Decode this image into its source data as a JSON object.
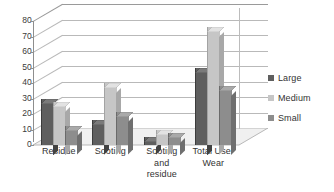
{
  "chart_data": {
    "type": "bar",
    "title": "",
    "xlabel": "",
    "ylabel": "",
    "categories": [
      "Residue",
      "Sooting",
      "Sooting and residue",
      "Total Use-Wear"
    ],
    "series": [
      {
        "name": "Large",
        "values": [
          30,
          16,
          5,
          50
        ],
        "color": "#5f5f5f"
      },
      {
        "name": "Medium",
        "values": [
          28,
          40,
          10,
          76
        ],
        "color": "#c6c6c6"
      },
      {
        "name": "Small",
        "values": [
          12,
          21,
          8,
          38
        ],
        "color": "#8d8d8d"
      }
    ],
    "ylim": [
      0,
      80
    ],
    "yticks": [
      0,
      10,
      20,
      30,
      40,
      50,
      60,
      70,
      80
    ],
    "ytick_labels": [
      "0",
      "10",
      "20",
      "30",
      "40",
      "50",
      "60",
      "70",
      "80"
    ],
    "grid": true,
    "legend_position": "right",
    "style": "3d-clustered-column"
  },
  "axis": {
    "ytick_labels": [
      "80",
      "70",
      "60",
      "50",
      "40",
      "30",
      "20",
      "10",
      "0"
    ],
    "category_labels": [
      "Residue",
      "Sooting",
      "Sooting\nand\nresidue",
      "Total Use-\nWear"
    ]
  },
  "legend": {
    "items": [
      {
        "label": "Large",
        "color": "#5f5f5f"
      },
      {
        "label": "Medium",
        "color": "#c6c6c6"
      },
      {
        "label": "Small",
        "color": "#8d8d8d"
      }
    ]
  },
  "colors": {
    "large": "#5f5f5f",
    "medium": "#c6c6c6",
    "small": "#8d8d8d",
    "gridline": "#b9b9b9",
    "axis": "#8e8e8e",
    "floor": "#efefef",
    "text": "#333333",
    "background": "#ffffff"
  }
}
